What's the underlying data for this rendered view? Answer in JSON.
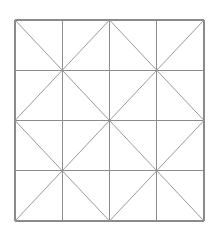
{
  "figure": {
    "kind": "geometric-line-drawing",
    "background_color": "#ffffff",
    "grid_line_color": "#8c8c8c",
    "border_line_color": "#8a8a8a",
    "diagonal_line_color": "#9a9a9a",
    "square": {
      "left": 15,
      "top": 20,
      "right": 204,
      "bottom": 221,
      "width": 189,
      "height": 201
    },
    "grid": {
      "columns": 4,
      "rows": 4,
      "x_positions": [
        15,
        62.25,
        109.5,
        156.75,
        204
      ],
      "y_positions": [
        20,
        70.25,
        120.5,
        170.75,
        221
      ]
    },
    "quadrants": {
      "count": 4,
      "cells_per_quadrant": 4,
      "centers": [
        {
          "name": "top-left-quadrant-center",
          "x": 62.25,
          "y": 70.25
        },
        {
          "name": "top-right-quadrant-center",
          "x": 156.75,
          "y": 70.25
        },
        {
          "name": "bottom-left-quadrant-center",
          "x": 62.25,
          "y": 170.75
        },
        {
          "name": "bottom-right-quadrant-center",
          "x": 156.75,
          "y": 170.75
        }
      ]
    },
    "vertical_lines": [
      {
        "name": "vertical-border-left",
        "x": 15,
        "y1": 20,
        "y2": 221,
        "role": "border"
      },
      {
        "name": "vertical-grid-1",
        "x": 62.25,
        "y1": 20,
        "y2": 221,
        "role": "grid"
      },
      {
        "name": "vertical-grid-2",
        "x": 109.5,
        "y1": 20,
        "y2": 221,
        "role": "grid"
      },
      {
        "name": "vertical-grid-3",
        "x": 156.75,
        "y1": 20,
        "y2": 221,
        "role": "grid"
      },
      {
        "name": "vertical-border-right",
        "x": 204,
        "y1": 20,
        "y2": 221,
        "role": "border"
      }
    ],
    "horizontal_lines": [
      {
        "name": "horizontal-border-top",
        "y": 20,
        "x1": 15,
        "x2": 204,
        "role": "border"
      },
      {
        "name": "horizontal-grid-1",
        "y": 70.25,
        "x1": 15,
        "x2": 204,
        "role": "grid"
      },
      {
        "name": "horizontal-grid-2",
        "y": 120.5,
        "x1": 15,
        "x2": 204,
        "role": "grid"
      },
      {
        "name": "horizontal-grid-3",
        "y": 170.75,
        "x1": 15,
        "x2": 204,
        "role": "grid"
      },
      {
        "name": "horizontal-border-bottom",
        "y": 221,
        "x1": 15,
        "x2": 204,
        "role": "border"
      }
    ],
    "diagonals": [
      {
        "name": "diagonal-q1-down",
        "x1": 15,
        "y1": 20,
        "x2": 109.5,
        "y2": 120.5
      },
      {
        "name": "diagonal-q1-up",
        "x1": 15,
        "y1": 120.5,
        "x2": 109.5,
        "y2": 20
      },
      {
        "name": "diagonal-q2-down",
        "x1": 109.5,
        "y1": 20,
        "x2": 204,
        "y2": 120.5
      },
      {
        "name": "diagonal-q2-up",
        "x1": 109.5,
        "y1": 120.5,
        "x2": 204,
        "y2": 20
      },
      {
        "name": "diagonal-q3-down",
        "x1": 15,
        "y1": 120.5,
        "x2": 109.5,
        "y2": 221
      },
      {
        "name": "diagonal-q3-up",
        "x1": 15,
        "y1": 221,
        "x2": 109.5,
        "y2": 120.5
      },
      {
        "name": "diagonal-q4-down",
        "x1": 109.5,
        "y1": 120.5,
        "x2": 204,
        "y2": 221
      },
      {
        "name": "diagonal-q4-up",
        "x1": 109.5,
        "y1": 221,
        "x2": 204,
        "y2": 120.5
      }
    ]
  }
}
